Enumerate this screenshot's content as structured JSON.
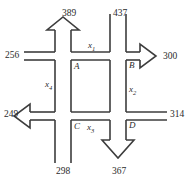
{
  "figure": {
    "type": "traffic-flow-network",
    "stroke_color": "#3d3d3d",
    "text_color": "#2b2b2b"
  },
  "nodes": [
    {
      "id": "A",
      "label": "A",
      "x": 64,
      "y": 68
    },
    {
      "id": "B",
      "label": "B",
      "x": 123,
      "y": 66
    },
    {
      "id": "C",
      "label": "C",
      "x": 64,
      "y": 127
    },
    {
      "id": "D",
      "label": "D",
      "x": 123,
      "y": 125
    }
  ],
  "variables": [
    {
      "id": "x1",
      "label": "x",
      "sub": "1",
      "edge": "A-B",
      "x": 91,
      "y": 45
    },
    {
      "id": "x2",
      "label": "x",
      "sub": "2",
      "edge": "B-D",
      "x": 124,
      "y": 88
    },
    {
      "id": "x3",
      "label": "x",
      "sub": "3",
      "edge": "C-D",
      "x": 81,
      "y": 127
    },
    {
      "id": "x4",
      "label": "x",
      "sub": "4",
      "edge": "A-C",
      "x": 49,
      "y": 84
    }
  ],
  "external_flows": [
    {
      "id": "flow-389",
      "value": "389",
      "direction": "out",
      "side": "top",
      "node": "A",
      "x": 62,
      "y": 9
    },
    {
      "id": "flow-437",
      "value": "437",
      "direction": "in",
      "side": "top",
      "node": "B",
      "x": 113,
      "y": 9
    },
    {
      "id": "flow-256",
      "value": "256",
      "direction": "in",
      "side": "left",
      "node": "A",
      "x": 5,
      "y": 55
    },
    {
      "id": "flow-300",
      "value": "300",
      "direction": "out",
      "side": "right",
      "node": "B",
      "x": 163,
      "y": 57
    },
    {
      "id": "flow-249",
      "value": "249",
      "direction": "out",
      "side": "left",
      "node": "C",
      "x": 5,
      "y": 111
    },
    {
      "id": "flow-314",
      "value": "314",
      "direction": "in",
      "side": "right",
      "node": "D",
      "x": 163,
      "y": 111
    },
    {
      "id": "flow-298",
      "value": "298",
      "direction": "in",
      "side": "bottom",
      "node": "C",
      "x": 57,
      "y": 167
    },
    {
      "id": "flow-367",
      "value": "367",
      "direction": "out",
      "side": "bottom",
      "node": "D",
      "x": 113,
      "y": 167
    }
  ]
}
